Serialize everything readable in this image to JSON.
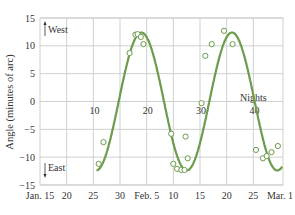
{
  "chart_data": {
    "type": "line",
    "title": "",
    "xlabel": "",
    "ylabel": "Angle (minutes of arc)",
    "ylim": [
      -15,
      15
    ],
    "yticks": [
      15,
      10,
      5,
      0,
      -5,
      -10,
      -15
    ],
    "ytick_labels": [
      "15",
      "10",
      "5",
      "0",
      "−5",
      "−10",
      "−15"
    ],
    "xticks_days": [
      0,
      5,
      10,
      15,
      21,
      26,
      31,
      36,
      41,
      45
    ],
    "xtick_labels": [
      "Jan. 15",
      "20",
      "25",
      "30",
      "Feb. 5",
      "10",
      "15",
      "20",
      "25",
      "Mar. 1"
    ],
    "x_unit": "days since Jan. 15",
    "xlim": [
      0,
      45.5
    ],
    "grid": true,
    "annotations": [
      {
        "text": "West",
        "position": "top-left",
        "arrow": "up"
      },
      {
        "text": "East",
        "position": "bottom-left",
        "arrow": "down"
      },
      {
        "text": "10",
        "x": 10.2,
        "y": 0,
        "kind": "night-label"
      },
      {
        "text": "20",
        "x": 20.2,
        "y": 0,
        "kind": "night-label"
      },
      {
        "text": "30",
        "x": 30.2,
        "y": 0,
        "kind": "night-label"
      },
      {
        "text": "Nights",
        "x": 40.0,
        "y": 2.5,
        "kind": "axis-label"
      },
      {
        "text": "40",
        "x": 40.2,
        "y": 0,
        "kind": "night-label"
      }
    ],
    "series": [
      {
        "name": "Fitted curve",
        "style": "line",
        "color": "#6b9b4b",
        "model": {
          "amplitude": 12.4,
          "period_days": 17.0,
          "peak_day": 19.0,
          "x_start": 10.6,
          "x_end": 45.5
        }
      },
      {
        "name": "Observations",
        "style": "open-circle",
        "color": "#6b9b4b",
        "x": [
          11.0,
          11.9,
          16.8,
          17.9,
          18.3,
          18.9,
          19.4,
          24.6,
          25.0,
          25.7,
          26.5,
          27.1,
          27.7,
          27.3,
          30.3,
          31.0,
          32.2,
          34.5,
          36.1,
          40.5,
          41.8,
          42.5,
          43.4,
          44.6
        ],
        "y": [
          -11.2,
          -7.3,
          8.7,
          12.0,
          12.1,
          11.6,
          10.3,
          -5.8,
          -11.2,
          -12.1,
          -12.3,
          -12.3,
          -10.2,
          -6.3,
          -0.3,
          8.2,
          10.3,
          12.7,
          10.3,
          -8.7,
          -10.2,
          -9.8,
          -9.1,
          -8.0
        ]
      }
    ]
  },
  "colors": {
    "curve": "#6b9b4b",
    "marker": "#6b9b4b",
    "grid": "#cfcfcf",
    "text": "#333333",
    "background": "#ffffff"
  }
}
